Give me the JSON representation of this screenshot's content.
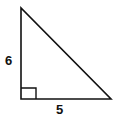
{
  "diagram": {
    "type": "right-triangle",
    "vertical_leg_label": "6",
    "horizontal_leg_label": "5",
    "right_angle_marker": true,
    "stroke_color": "#111111",
    "background": "#ffffff"
  }
}
